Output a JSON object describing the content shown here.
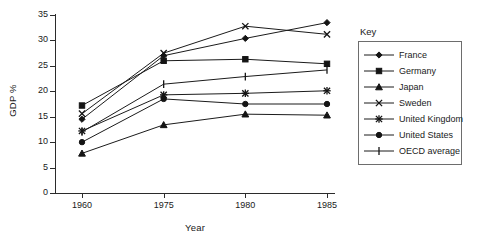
{
  "chart_data": {
    "type": "line",
    "title": "",
    "xlabel": "Year",
    "ylabel": "GDP %",
    "categories": [
      "1960",
      "1975",
      "1980",
      "1985"
    ],
    "ylim": [
      0,
      35
    ],
    "yticks": [
      0,
      5,
      10,
      15,
      20,
      25,
      30,
      35
    ],
    "grid": false,
    "legend_position": "right-outside",
    "legend_title": "Key",
    "series": [
      {
        "name": "France",
        "marker": "diamond",
        "values": [
          14.5,
          27.0,
          30.4,
          33.5
        ]
      },
      {
        "name": "Germany",
        "marker": "square",
        "values": [
          17.2,
          26.0,
          26.3,
          25.4
        ]
      },
      {
        "name": "Japan",
        "marker": "triangle",
        "values": [
          7.8,
          13.4,
          15.5,
          15.3
        ]
      },
      {
        "name": "Sweden",
        "marker": "cross",
        "values": [
          15.6,
          27.5,
          32.8,
          31.2
        ]
      },
      {
        "name": "United Kingdom",
        "marker": "star",
        "values": [
          12.2,
          19.3,
          19.6,
          20.1
        ]
      },
      {
        "name": "United States",
        "marker": "circle",
        "values": [
          10.0,
          18.5,
          17.5,
          17.5
        ]
      },
      {
        "name": "OECD average",
        "marker": "plus",
        "values": [
          12.0,
          21.4,
          22.9,
          24.2
        ]
      }
    ]
  },
  "colors": {
    "line": "#1b1b1b",
    "axis": "#2b2b2b",
    "legend_border": "#6d6d6d",
    "background": "#ffffff"
  }
}
